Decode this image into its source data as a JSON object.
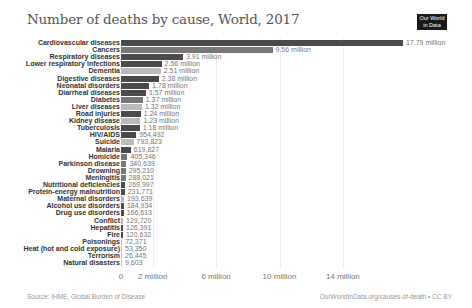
{
  "header": {
    "title": "Number of deaths by cause, World, 2017",
    "logo_line1": "Our World",
    "logo_line2": "in Data"
  },
  "footer": {
    "source": "Source: IHME, Global Burden of Disease",
    "url": "OurWorldInData.org/causes-of-death • CC BY"
  },
  "axis": {
    "ticks": [
      {
        "label": "0",
        "value": 0
      },
      {
        "label": "2 million",
        "value": 2000000
      },
      {
        "label": "6 million",
        "value": 6000000
      },
      {
        "label": "10 million",
        "value": 10000000
      },
      {
        "label": "14 million",
        "value": 14000000
      }
    ]
  },
  "colors": {
    "dark": "#4a4a4a",
    "mid": "#777777",
    "light": "#bbbbbb"
  },
  "chart_data": {
    "type": "bar",
    "orientation": "horizontal",
    "title": "Number of deaths by cause, World, 2017",
    "xlabel": "",
    "ylabel": "",
    "xlim": [
      0,
      18000000
    ],
    "grid": true,
    "categories": [
      "Cardiovascular diseases",
      "Cancers",
      "Respiratory diseases",
      "Lower respiratory infections",
      "Dementia",
      "Digestive diseases",
      "Neonatal disorders",
      "Diarrheal diseases",
      "Diabetes",
      "Liver diseases",
      "Road injuries",
      "Kidney disease",
      "Tuberculosis",
      "HIV/AIDS",
      "Suicide",
      "Malaria",
      "Homicide",
      "Parkinson disease",
      "Drowning",
      "Meningitis",
      "Nutritional deficiencies",
      "Protein-energy malnutrition",
      "Maternal disorders",
      "Alcohol use disorders",
      "Drug use disorders",
      "Conflict",
      "Hepatitis",
      "Fire",
      "Poisonings",
      "Heat (hot and cold exposure)",
      "Terrorism",
      "Natural disasters"
    ],
    "values": [
      17790000,
      9560000,
      3910000,
      2560000,
      2510000,
      2380000,
      1780000,
      1570000,
      1370000,
      1320000,
      1240000,
      1230000,
      1180000,
      954492,
      793823,
      619827,
      405346,
      340639,
      295210,
      288021,
      269997,
      231771,
      193639,
      184934,
      166613,
      129720,
      126391,
      120632,
      72371,
      53350,
      26445,
      9603
    ],
    "value_labels": [
      "17.79 million",
      "9.56 million",
      "3.91 million",
      "2.56 million",
      "2.51 million",
      "2.38 million",
      "1.78 million",
      "1.57 million",
      "1.37 million",
      "1.32 million",
      "1.24 million",
      "1.23 million",
      "1.18 million",
      "954,492",
      "793,823",
      "619,827",
      "405,346",
      "340,639",
      "295,210",
      "288,021",
      "269,997",
      "231,771",
      "193,639",
      "184,934",
      "166,613",
      "129,720",
      "126,391",
      "120,632",
      "72,371",
      "53,350",
      "26,445",
      "9,603"
    ],
    "bar_shades": [
      "dark",
      "mid",
      "dark",
      "dark",
      "light",
      "dark",
      "dark",
      "dark",
      "mid",
      "light",
      "dark",
      "light",
      "dark",
      "dark",
      "light",
      "dark",
      "mid",
      "mid",
      "mid",
      "mid",
      "dark",
      "dark",
      "light",
      "dark",
      "dark",
      "light",
      "dark",
      "dark",
      "light",
      "light",
      "light",
      "light"
    ]
  }
}
